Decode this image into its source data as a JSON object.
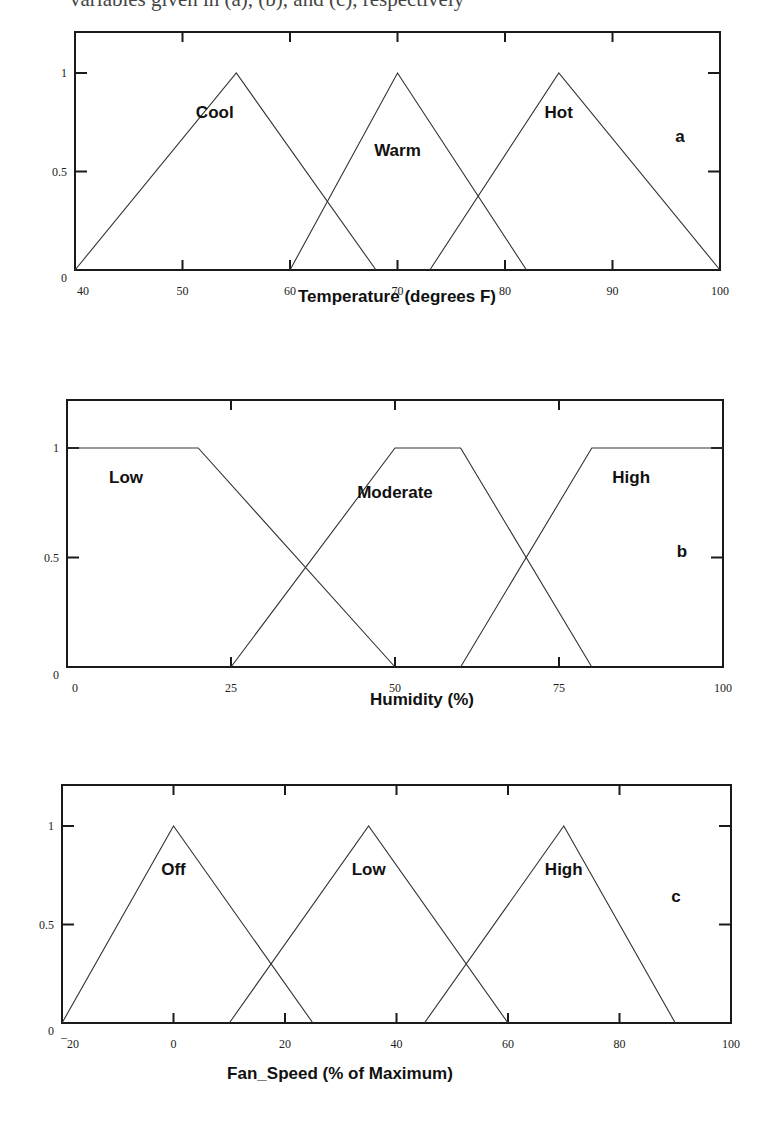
{
  "header_fragment": "variables given in (a), (b), and (c), respectively",
  "chart_data": [
    {
      "type": "line",
      "panel": "a",
      "title": "",
      "xlabel": "Temperature (degrees F)",
      "ylabel": "",
      "xlim": [
        40,
        100
      ],
      "ylim": [
        0,
        1
      ],
      "x_ticks": [
        40,
        50,
        60,
        70,
        80,
        90,
        100
      ],
      "y_ticks": [
        0,
        0.5,
        1
      ],
      "y_tick_labels": [
        "0",
        "0.5",
        "1"
      ],
      "grid": false,
      "series": [
        {
          "name": "Cool",
          "x": [
            40,
            55,
            68
          ],
          "y": [
            0,
            1,
            0
          ],
          "label_at": [
            53,
            0.77
          ]
        },
        {
          "name": "Warm",
          "x": [
            60,
            70,
            82
          ],
          "y": [
            0,
            1,
            0
          ],
          "label_at": [
            70,
            0.58
          ]
        },
        {
          "name": "Hot",
          "x": [
            73,
            85,
            100
          ],
          "y": [
            0,
            1,
            0
          ],
          "label_at": [
            85,
            0.77
          ]
        }
      ]
    },
    {
      "type": "line",
      "panel": "b",
      "title": "",
      "xlabel": "Humidity (%)",
      "ylabel": "",
      "xlim": [
        0,
        100
      ],
      "ylim": [
        0,
        1
      ],
      "x_ticks": [
        0,
        25,
        50,
        75,
        100
      ],
      "y_ticks": [
        0,
        0.5,
        1
      ],
      "y_tick_labels": [
        "0",
        "0.5",
        "1"
      ],
      "grid": false,
      "series": [
        {
          "name": "Low",
          "x": [
            0,
            20,
            50
          ],
          "y": [
            1,
            1,
            0
          ],
          "label_at": [
            9,
            0.84
          ]
        },
        {
          "name": "Moderate",
          "x": [
            25,
            50,
            60,
            80
          ],
          "y": [
            0,
            1,
            1,
            0
          ],
          "label_at": [
            50,
            0.77
          ]
        },
        {
          "name": "High",
          "x": [
            60,
            80,
            100
          ],
          "y": [
            0,
            1,
            1
          ],
          "label_at": [
            86,
            0.84
          ]
        }
      ]
    },
    {
      "type": "line",
      "panel": "c",
      "title": "",
      "xlabel": "Fan_Speed (% of Maximum)",
      "ylabel": "",
      "xlim": [
        -20,
        100
      ],
      "ylim": [
        0,
        1
      ],
      "x_ticks": [
        -20,
        0,
        20,
        40,
        60,
        80,
        100
      ],
      "y_ticks": [
        0,
        0.5,
        1
      ],
      "y_tick_labels": [
        "0",
        "0.5",
        "1"
      ],
      "grid": false,
      "series": [
        {
          "name": "Off",
          "x": [
            -20,
            0,
            25
          ],
          "y": [
            0,
            1,
            0
          ],
          "label_at": [
            0,
            0.75
          ]
        },
        {
          "name": "Low",
          "x": [
            10,
            35,
            60
          ],
          "y": [
            0,
            1,
            0
          ],
          "label_at": [
            35,
            0.75
          ]
        },
        {
          "name": "High",
          "x": [
            45,
            70,
            90
          ],
          "y": [
            0,
            1,
            0
          ],
          "label_at": [
            70,
            0.75
          ]
        }
      ]
    }
  ],
  "panels": [
    {
      "label": "a",
      "box": {
        "left": 75,
        "top": 32,
        "right": 720,
        "bottom": 270
      },
      "y1_px": 73,
      "title_y": 302,
      "title_x": 397,
      "label_pos": [
        680,
        142
      ]
    },
    {
      "label": "b",
      "box": {
        "left": 67,
        "top": 400,
        "right": 723,
        "bottom": 667
      },
      "y1_px": 448,
      "title_y": 705,
      "title_x": 422,
      "label_pos": [
        682,
        557
      ]
    },
    {
      "label": "c",
      "box": {
        "left": 62,
        "top": 785,
        "right": 731,
        "bottom": 1023
      },
      "y1_px": 826,
      "title_y": 1079,
      "title_x": 340,
      "label_pos": [
        676,
        902
      ]
    }
  ]
}
